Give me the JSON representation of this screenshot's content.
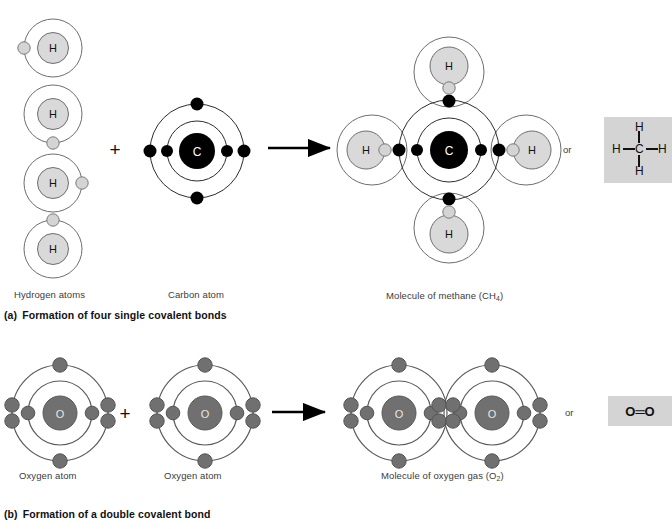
{
  "figure": {
    "background": "#ffffff",
    "width": 672,
    "height": 529
  },
  "colors": {
    "orbit_stroke": "#4a4a4a",
    "orbit_stroke_light": "#6e6e6e",
    "hydrogen_nucleus_fill": "#d9d9d9",
    "hydrogen_nucleus_stroke": "#6e6e6e",
    "hydrogen_electron_fill": "#d4d4d4",
    "hydrogen_electron_stroke": "#7a7a7a",
    "carbon_nucleus_fill": "#000000",
    "carbon_electron_fill": "#000000",
    "oxygen_nucleus_fill": "#707070",
    "oxygen_nucleus_stroke": "#5a5a5a",
    "oxygen_electron_fill": "#707070",
    "oxygen_electron_stroke": "#545454",
    "arrow_color": "#000000",
    "formula_box_bg": "#d4d4d4",
    "text_color": "#3b3b3b",
    "caption_color": "#111111"
  },
  "panel_a": {
    "caption_letter": "(a)",
    "caption_text": "Formation of four single covalent bonds",
    "labels": {
      "reactant_left": "Hydrogen atoms",
      "reactant_right": "Carbon atom",
      "product": "Molecule of methane (CH",
      "product_sub": "4",
      "product_tail": ")"
    },
    "plus_sign": "+",
    "or_word": "or",
    "hydrogen_atoms": [
      {
        "label": "H",
        "electron_position": "left"
      },
      {
        "label": "H",
        "electron_position": "bottom"
      },
      {
        "label": "H",
        "electron_position": "right"
      },
      {
        "label": "H",
        "electron_position": "top"
      }
    ],
    "carbon_atom": {
      "label": "C",
      "inner_shell_electrons": 2,
      "outer_shell_electrons": 4,
      "outer_positions": [
        "left",
        "right",
        "top",
        "bottom"
      ]
    },
    "methane": {
      "center_label": "C",
      "bonded_hydrogens": 4,
      "hydrogen_label": "H",
      "bonds": "four single covalent bonds"
    },
    "structural_formula": {
      "center": "C",
      "top": "H",
      "bottom": "H",
      "left": "H",
      "right": "H",
      "name": "methane structural formula"
    }
  },
  "panel_b": {
    "caption_letter": "(b)",
    "caption_text": "Formation of a double covalent bond",
    "labels": {
      "reactant_left": "Oxygen atom",
      "reactant_right": "Oxygen atom",
      "product": "Molecule of oxygen gas (O",
      "product_sub": "2",
      "product_tail": ")"
    },
    "plus_sign": "+",
    "or_word": "or",
    "oxygen_atoms": [
      {
        "label": "O",
        "inner_shell_electrons": 2,
        "outer_shell_electrons": 6
      },
      {
        "label": "O",
        "inner_shell_electrons": 2,
        "outer_shell_electrons": 6
      }
    ],
    "oxygen_molecule": {
      "left_label": "O",
      "right_label": "O",
      "shared_electrons": 4,
      "bond_type": "double covalent bond"
    },
    "structural_formula": {
      "text": "O═O",
      "left": "O",
      "right": "O",
      "bond_glyph": "=",
      "name": "oxygen structural formula"
    }
  }
}
